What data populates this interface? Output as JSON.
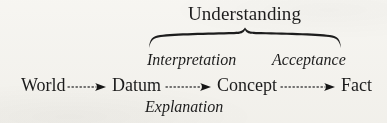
{
  "figure": {
    "kind": "concept-flow-diagram",
    "background_color": "#f8f7f4",
    "ink_color": "#1d1d1d"
  },
  "heading": {
    "label": "Understanding",
    "style": "roman"
  },
  "brace": {
    "name": "horizontal-curly-brace",
    "spans_from": "Datum",
    "spans_to": "Fact",
    "groups_label": "Understanding"
  },
  "above_labels": [
    {
      "label": "Interpretation",
      "style": "italic",
      "relates_to_arrow": 2
    },
    {
      "label": "Acceptance",
      "style": "italic",
      "relates_to_arrow": 3
    }
  ],
  "below_labels": [
    {
      "label": "Explanation",
      "style": "italic",
      "relates_to_arrow": 2
    }
  ],
  "chain": {
    "nodes": [
      {
        "label": "World",
        "style": "roman"
      },
      {
        "label": "Datum",
        "style": "roman"
      },
      {
        "label": "Concept",
        "style": "roman"
      },
      {
        "label": "Fact",
        "style": "roman"
      }
    ],
    "arrows": [
      {
        "name": "arrow-world-to-datum",
        "line": "dotted",
        "head": "solid-triangle"
      },
      {
        "name": "arrow-datum-to-concept",
        "line": "dotted",
        "head": "solid-triangle"
      },
      {
        "name": "arrow-concept-to-fact",
        "line": "dotted",
        "head": "solid-triangle"
      }
    ]
  }
}
